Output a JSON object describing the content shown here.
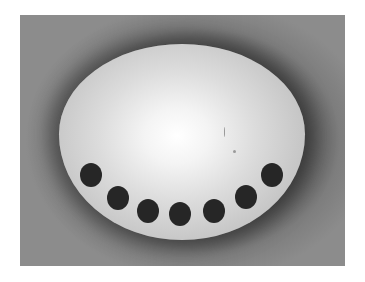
{
  "image": {
    "description": "Grayscale photo of an egg-shaped white oval on a gray background with a semicircular row of seven dark dots along its lower edge",
    "colors": {
      "background": "#8a8a8a",
      "vignette": "#3a3a3a",
      "oval_center": "#ffffff",
      "oval_edge": "#c4c4c4",
      "dots": "#262626"
    },
    "dot_count": 7,
    "dots": [
      {
        "x": 91,
        "y": 175
      },
      {
        "x": 118,
        "y": 198
      },
      {
        "x": 148,
        "y": 211
      },
      {
        "x": 180,
        "y": 214
      },
      {
        "x": 214,
        "y": 211
      },
      {
        "x": 246,
        "y": 197
      },
      {
        "x": 272,
        "y": 175
      }
    ]
  }
}
